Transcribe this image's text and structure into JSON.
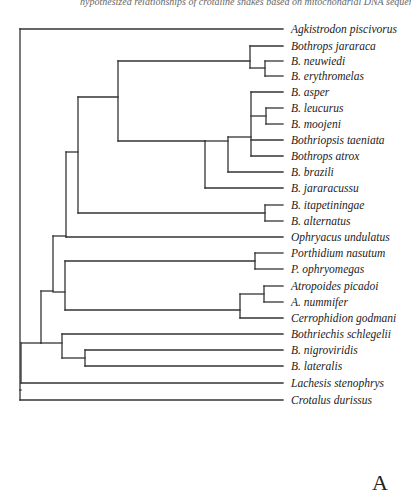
{
  "figure": {
    "header_text": "hypothesized relationships of crotaline snakes based on mitochondrial DNA sequence data",
    "panel_label": "A",
    "line_color": "#333333",
    "leaves": [
      {
        "name": "Agkistrodon piscivorus",
        "y": 29
      },
      {
        "name": "Bothrops jararaca",
        "y": 46
      },
      {
        "name": "B. neuwiedi",
        "y": 61
      },
      {
        "name": "B. erythromelas",
        "y": 76
      },
      {
        "name": "B. asper",
        "y": 92
      },
      {
        "name": "B. leucurus",
        "y": 108
      },
      {
        "name": "B. moojeni",
        "y": 124
      },
      {
        "name": "Bothriopsis taeniata",
        "y": 140
      },
      {
        "name": "Bothrops atrox",
        "y": 156
      },
      {
        "name": "B. brazili",
        "y": 172
      },
      {
        "name": "B. jararacussu",
        "y": 188
      },
      {
        "name": "B. itapetiningae",
        "y": 205
      },
      {
        "name": "B. alternatus",
        "y": 221
      },
      {
        "name": "Ophryacus undulatus",
        "y": 237
      },
      {
        "name": "Porthidium nasutum",
        "y": 253
      },
      {
        "name": "P. ophryomegas",
        "y": 269
      },
      {
        "name": "Atropoides picadoi",
        "y": 286
      },
      {
        "name": "A. nummifer",
        "y": 302
      },
      {
        "name": "Cerrophidion godmani",
        "y": 318
      },
      {
        "name": "Bothriechis schlegelii",
        "y": 334
      },
      {
        "name": "B. nigroviridis",
        "y": 350
      },
      {
        "name": "B. lateralis",
        "y": 366
      },
      {
        "name": "Lachesis stenophrys",
        "y": 383
      },
      {
        "name": "Crotalus durissus",
        "y": 400
      }
    ]
  }
}
